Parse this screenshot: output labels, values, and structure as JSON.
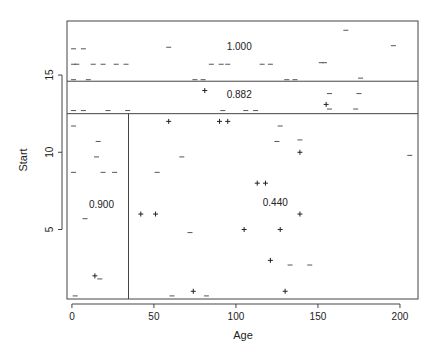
{
  "chart_data": {
    "type": "scatter",
    "title": "",
    "xlabel": "Age",
    "ylabel": "Start",
    "xlim": [
      -3,
      211
    ],
    "ylim": [
      0.5,
      18.5
    ],
    "xticks": [
      0,
      50,
      100,
      150,
      200
    ],
    "yticks": [
      5,
      10,
      15
    ],
    "grid": false,
    "legend": null,
    "partition_lines": [
      {
        "orientation": "horizontal",
        "y": 14.6,
        "x_from": -3,
        "x_to": 211
      },
      {
        "orientation": "horizontal",
        "y": 12.5,
        "x_from": -3,
        "x_to": 211
      },
      {
        "orientation": "vertical",
        "x": 34.5,
        "y_from": 0.5,
        "y_to": 12.5
      }
    ],
    "region_labels": [
      {
        "text": "1.000",
        "x": 102,
        "y": 16.6
      },
      {
        "text": "0.882",
        "x": 102,
        "y": 13.5
      },
      {
        "text": "0.900",
        "x": 18,
        "y": 6.4
      },
      {
        "text": "0.440",
        "x": 124,
        "y": 6.5
      }
    ],
    "series": [
      {
        "name": "absent",
        "marker": "-",
        "points": [
          [
            1,
            16.7
          ],
          [
            7,
            16.7
          ],
          [
            1,
            15.7
          ],
          [
            3,
            15.7
          ],
          [
            13,
            15.7
          ],
          [
            19,
            15.7
          ],
          [
            27,
            15.7
          ],
          [
            33,
            15.7
          ],
          [
            1,
            14.7
          ],
          [
            10,
            14.7
          ],
          [
            59,
            16.8
          ],
          [
            75,
            14.7
          ],
          [
            80,
            14.7
          ],
          [
            85,
            15.7
          ],
          [
            91,
            15.7
          ],
          [
            95,
            15.7
          ],
          [
            116,
            15.7
          ],
          [
            121,
            15.7
          ],
          [
            131,
            14.7
          ],
          [
            136,
            14.7
          ],
          [
            152,
            15.8
          ],
          [
            154,
            15.8
          ],
          [
            167,
            17.9
          ],
          [
            176,
            14.8
          ],
          [
            196,
            16.9
          ],
          [
            1,
            12.7
          ],
          [
            7,
            12.7
          ],
          [
            22,
            12.7
          ],
          [
            34,
            12.7
          ],
          [
            92,
            12.7
          ],
          [
            106,
            12.7
          ],
          [
            112,
            12.7
          ],
          [
            157,
            13.8
          ],
          [
            157,
            12.8
          ],
          [
            175,
            13.8
          ],
          [
            173,
            12.8
          ],
          [
            1,
            11.7
          ],
          [
            16,
            10.7
          ],
          [
            15,
            9.7
          ],
          [
            1,
            8.7
          ],
          [
            19,
            8.7
          ],
          [
            26,
            8.7
          ],
          [
            52,
            8.7
          ],
          [
            67,
            9.7
          ],
          [
            127,
            11.7
          ],
          [
            125,
            10.7
          ],
          [
            139,
            10.8
          ],
          [
            206,
            9.8
          ],
          [
            8,
            5.7
          ],
          [
            72,
            4.8
          ],
          [
            17,
            1.8
          ],
          [
            2,
            0.7
          ],
          [
            61,
            0.7
          ],
          [
            82,
            0.7
          ],
          [
            133,
            2.7
          ],
          [
            145,
            2.7
          ]
        ]
      },
      {
        "name": "present",
        "marker": "+",
        "points": [
          [
            81,
            14.0
          ],
          [
            155,
            13.1
          ],
          [
            59,
            12.0
          ],
          [
            90,
            12.0
          ],
          [
            95,
            12.0
          ],
          [
            139,
            10.0
          ],
          [
            113,
            8.0
          ],
          [
            118,
            8.0
          ],
          [
            139,
            6.0
          ],
          [
            42,
            6.0
          ],
          [
            51,
            6.0
          ],
          [
            105,
            5.0
          ],
          [
            127,
            5.0
          ],
          [
            14,
            2.0
          ],
          [
            121,
            3.0
          ],
          [
            74,
            1.0
          ],
          [
            130,
            1.0
          ]
        ]
      }
    ]
  },
  "axes": {
    "x_label": "Age",
    "y_label": "Start",
    "x_tick_labels": [
      "0",
      "50",
      "100",
      "150",
      "200"
    ],
    "y_tick_labels": [
      "5",
      "10",
      "15"
    ]
  }
}
